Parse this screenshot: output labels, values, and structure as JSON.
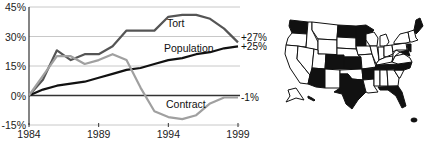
{
  "chart_data": {
    "type": "line",
    "title": "",
    "xlabel": "",
    "ylabel": "",
    "x": [
      1984,
      1985,
      1986,
      1987,
      1988,
      1989,
      1990,
      1991,
      1992,
      1993,
      1994,
      1995,
      1996,
      1997,
      1998,
      1999
    ],
    "xlim": [
      1984,
      1999
    ],
    "ylim": [
      -15,
      45
    ],
    "grid": true,
    "x_ticks": [
      "1984",
      "1989",
      "1994",
      "1999"
    ],
    "x_tick_values": [
      1984,
      1989,
      1994,
      1999
    ],
    "y_ticks": [
      "45%",
      "30%",
      "15%",
      "0%",
      "-15%"
    ],
    "y_tick_values": [
      45,
      30,
      15,
      0,
      -15
    ],
    "legend": "inline",
    "series": [
      {
        "name": "Tort",
        "color": "#555555",
        "values": [
          0,
          8,
          23,
          18,
          21,
          21,
          25,
          33,
          33,
          33,
          40,
          41,
          41,
          39,
          34,
          27
        ],
        "end_label": "+27%"
      },
      {
        "name": "Population",
        "color": "#111111",
        "values": [
          0,
          3,
          5,
          6,
          7,
          9,
          11,
          13,
          14,
          16,
          18,
          19,
          21,
          22,
          24,
          25
        ],
        "end_label": "+25%"
      },
      {
        "name": "Contract",
        "color": "#a0a0a0",
        "values": [
          0,
          10,
          20,
          20,
          16,
          18,
          21,
          18,
          4,
          -8,
          -11,
          -12,
          -10,
          -4,
          -1,
          -1
        ],
        "end_label": "-1%"
      }
    ]
  },
  "map": {
    "description": "US states map with some states shaded",
    "shaded_color": "#111111",
    "unshaded_color": "#ffffff",
    "shaded_states": [
      "WA",
      "MT",
      "ND",
      "MN",
      "CO",
      "KS",
      "AZ",
      "NM-border",
      "OK",
      "TX",
      "AR",
      "TN",
      "NC",
      "VA",
      "MS",
      "FL",
      "ME",
      "NY-east",
      "NJ",
      "DE",
      "MD"
    ]
  }
}
